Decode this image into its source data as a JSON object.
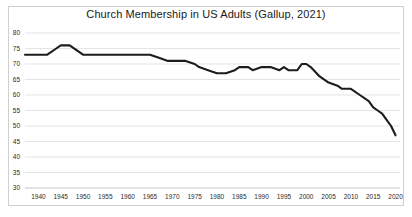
{
  "chart_data": {
    "type": "line",
    "title": "Church Membership in US Adults (Gallup, 2021)",
    "xlabel": "",
    "ylabel": "",
    "xlim": [
      1937,
      2021
    ],
    "ylim": [
      30,
      80
    ],
    "grid": true,
    "legend": null,
    "legend_position": "none",
    "line_color": "#1c1c1c",
    "grid_color": "#d9d9d9",
    "frame_color": "#d0d0d0",
    "yticks": [
      30,
      35,
      40,
      45,
      50,
      55,
      60,
      65,
      70,
      75,
      80
    ],
    "xticks": [
      1940,
      1945,
      1950,
      1955,
      1960,
      1965,
      1970,
      1975,
      1980,
      1985,
      1990,
      1995,
      2000,
      2005,
      2010,
      2015,
      2020
    ],
    "series": [
      {
        "name": "Church membership (% of US adults)",
        "x": [
          1937,
          1940,
          1942,
          1944,
          1945,
          1947,
          1950,
          1952,
          1955,
          1958,
          1960,
          1962,
          1965,
          1967,
          1969,
          1971,
          1973,
          1975,
          1976,
          1978,
          1980,
          1982,
          1984,
          1985,
          1987,
          1988,
          1990,
          1992,
          1994,
          1995,
          1996,
          1998,
          1999,
          2000,
          2001,
          2003,
          2005,
          2007,
          2008,
          2009,
          2010,
          2012,
          2014,
          2015,
          2016,
          2017,
          2018,
          2019,
          2020
        ],
        "values": [
          73,
          73,
          73,
          75,
          76,
          76,
          73,
          73,
          73,
          73,
          73,
          73,
          73,
          72,
          71,
          71,
          71,
          70,
          69,
          68,
          67,
          67,
          68,
          69,
          69,
          68,
          69,
          69,
          68,
          69,
          68,
          68,
          70,
          70,
          69,
          66,
          64,
          63,
          62,
          62,
          62,
          60,
          58,
          56,
          55,
          54,
          52,
          50,
          47
        ]
      }
    ]
  }
}
